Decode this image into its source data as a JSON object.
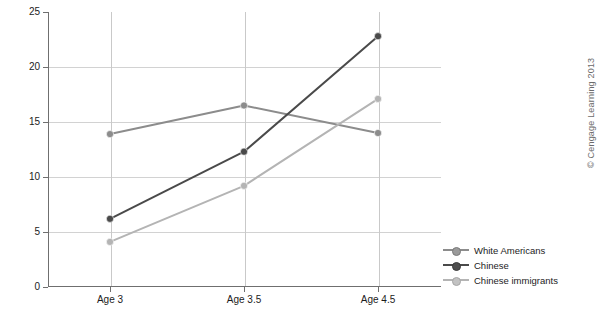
{
  "chart_data": {
    "type": "line",
    "title": "",
    "xlabel": "",
    "ylabel": "Mean emotional knowledge scores",
    "categories": [
      "Age 3",
      "Age 3.5",
      "Age 4.5"
    ],
    "ylim": [
      0,
      25
    ],
    "yticks": [
      0,
      5,
      10,
      15,
      20,
      25
    ],
    "ytick_labels": [
      "0",
      "5",
      "10",
      "15",
      "20",
      "25"
    ],
    "grid": "horizontal-and-category-verticals",
    "legend_position": "right-bottom-outside",
    "series": [
      {
        "name": "White Americans",
        "color": "#8c8c8c",
        "marker": "circle",
        "values": [
          13.9,
          16.5,
          14.0
        ]
      },
      {
        "name": "Chinese",
        "color": "#4a4a4a",
        "marker": "circle",
        "values": [
          6.2,
          12.3,
          22.8
        ]
      },
      {
        "name": "Chinese immigrants",
        "color": "#b4b4b4",
        "marker": "circle",
        "values": [
          4.1,
          9.2,
          17.1
        ]
      }
    ]
  },
  "axes": {
    "y_title": "Mean emotional knowledge scores",
    "y_tick_labels": [
      "25",
      "20",
      "15",
      "10",
      "5",
      "0"
    ],
    "x_tick_labels": [
      "Age 3",
      "Age 3.5",
      "Age 4.5"
    ]
  },
  "legend": {
    "items": [
      {
        "label": "White Americans",
        "color": "#8c8c8c"
      },
      {
        "label": "Chinese",
        "color": "#4a4a4a"
      },
      {
        "label": "Chinese immigrants",
        "color": "#b4b4b4"
      }
    ]
  },
  "credit": {
    "text": "© Cengage Learning 2013"
  }
}
